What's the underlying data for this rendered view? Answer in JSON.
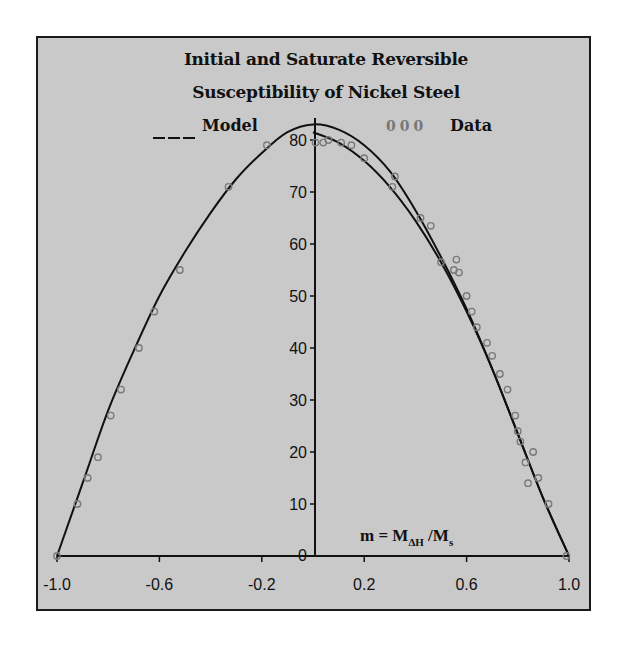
{
  "chart_data": {
    "type": "line",
    "title": "Initial and Saturate Reversible Susceptibility of Nickel Steel",
    "title_lines": [
      "Initial and Saturate Reversible",
      "Susceptibility of Nickel Steel"
    ],
    "xlabel": "m = M_ΔH / M_s",
    "xlabel_parts": {
      "main": "m = M",
      "sub1": "ΔH",
      "mid": " /M",
      "sub2": "s"
    },
    "ylabel": "",
    "xlim": [
      -1.0,
      1.0
    ],
    "ylim": [
      0,
      80
    ],
    "x_ticks": [
      "-1.0",
      "-0.6",
      "-0.2",
      "0.2",
      "0.6",
      "1.0"
    ],
    "x_tick_values": [
      -1.0,
      -0.6,
      -0.2,
      0.2,
      0.6,
      1.0
    ],
    "y_ticks": [
      "0",
      "10",
      "20",
      "30",
      "40",
      "50",
      "60",
      "70",
      "80"
    ],
    "y_tick_values": [
      0,
      10,
      20,
      30,
      40,
      50,
      60,
      70,
      80
    ],
    "grid": false,
    "legend": [
      {
        "label": "Model",
        "marker": "___",
        "style": "line"
      },
      {
        "label": "Data",
        "marker": "000",
        "style": "circles"
      }
    ],
    "legend_position": "top",
    "series": [
      {
        "name": "Model (upper)",
        "type": "line",
        "x": [
          -1.0,
          -0.9,
          -0.8,
          -0.7,
          -0.6,
          -0.5,
          -0.4,
          -0.3,
          -0.2,
          -0.1,
          0.0,
          0.1,
          0.2,
          0.3,
          0.4,
          0.5,
          0.6,
          0.7,
          0.8,
          0.9,
          1.0
        ],
        "y": [
          0,
          14,
          28,
          39.5,
          50,
          58.5,
          66,
          72.5,
          77.5,
          81.5,
          83,
          82,
          79,
          74,
          66.5,
          57.5,
          47.5,
          36,
          23.5,
          11,
          0
        ]
      },
      {
        "name": "Model (lower, right branch)",
        "type": "line",
        "x": [
          0.0,
          0.1,
          0.2,
          0.3,
          0.4,
          0.5,
          0.6,
          0.7,
          0.8,
          0.9,
          1.0
        ],
        "y": [
          81.5,
          79.5,
          76,
          71,
          64.5,
          56.5,
          47,
          36,
          23.5,
          11,
          0
        ]
      },
      {
        "name": "Data",
        "type": "scatter",
        "x": [
          -1.0,
          -0.92,
          -0.88,
          -0.84,
          -0.79,
          -0.75,
          -0.68,
          -0.62,
          -0.52,
          -0.33,
          -0.18,
          0.01,
          0.04,
          0.06,
          0.11,
          0.15,
          0.2,
          0.31,
          0.32,
          0.42,
          0.46,
          0.5,
          0.55,
          0.56,
          0.57,
          0.6,
          0.62,
          0.64,
          0.68,
          0.7,
          0.73,
          0.76,
          0.79,
          0.8,
          0.81,
          0.83,
          0.84,
          0.86,
          0.88,
          0.92,
          0.99
        ],
        "y": [
          0,
          10,
          15,
          19,
          27,
          32,
          40,
          47,
          55,
          71,
          79,
          79.5,
          79.5,
          80,
          79.5,
          79,
          76.5,
          71,
          73,
          65,
          63.5,
          56.5,
          55,
          57,
          54.5,
          50,
          47,
          44,
          41,
          38.5,
          35,
          32,
          27,
          24,
          22,
          18,
          14,
          20,
          15,
          10,
          0
        ]
      }
    ]
  }
}
